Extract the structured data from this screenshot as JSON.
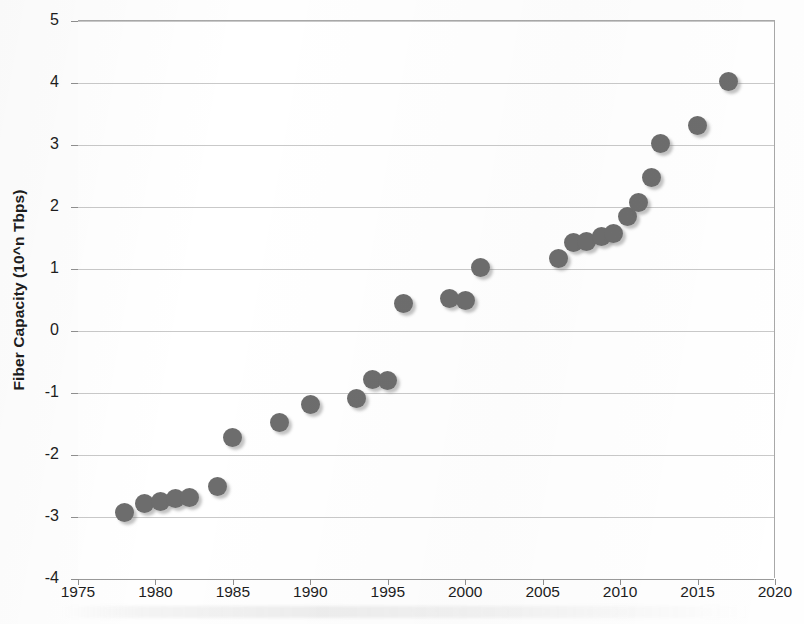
{
  "chart_data": {
    "type": "scatter",
    "title": "",
    "xlabel": "",
    "ylabel": "Fiber Capacity (10^n Tbps)",
    "xlim": [
      1975,
      2020
    ],
    "ylim": [
      -4,
      5
    ],
    "grid": true,
    "legend": "none",
    "marker_color": "#6d6d6d",
    "xticks": [
      "1975",
      "1980",
      "1985",
      "1990",
      "1995",
      "2000",
      "2005",
      "2010",
      "2015",
      "2020"
    ],
    "yticks": [
      "-4",
      "-3",
      "-2",
      "-1",
      "0",
      "1",
      "2",
      "3",
      "4",
      "5"
    ],
    "series": [
      {
        "name": "Fiber Capacity",
        "points": [
          {
            "x": 1978.0,
            "y": -2.92
          },
          {
            "x": 1979.3,
            "y": -2.78
          },
          {
            "x": 1980.3,
            "y": -2.75
          },
          {
            "x": 1981.3,
            "y": -2.7
          },
          {
            "x": 1982.2,
            "y": -2.68
          },
          {
            "x": 1984.0,
            "y": -2.5
          },
          {
            "x": 1985.0,
            "y": -1.72
          },
          {
            "x": 1988.0,
            "y": -1.47
          },
          {
            "x": 1990.0,
            "y": -1.19
          },
          {
            "x": 1993.0,
            "y": -1.09
          },
          {
            "x": 1994.0,
            "y": -0.78
          },
          {
            "x": 1995.0,
            "y": -0.8
          },
          {
            "x": 1996.0,
            "y": 0.44
          },
          {
            "x": 1999.0,
            "y": 0.53
          },
          {
            "x": 2000.0,
            "y": 0.5
          },
          {
            "x": 2001.0,
            "y": 1.02
          },
          {
            "x": 2006.0,
            "y": 1.17
          },
          {
            "x": 2007.0,
            "y": 1.43
          },
          {
            "x": 2007.8,
            "y": 1.44
          },
          {
            "x": 2008.8,
            "y": 1.52
          },
          {
            "x": 2009.6,
            "y": 1.58
          },
          {
            "x": 2010.5,
            "y": 1.85
          },
          {
            "x": 2011.2,
            "y": 2.08
          },
          {
            "x": 2012.0,
            "y": 2.48
          },
          {
            "x": 2012.6,
            "y": 3.03
          },
          {
            "x": 2015.0,
            "y": 3.32
          },
          {
            "x": 2017.0,
            "y": 4.02
          }
        ]
      }
    ]
  }
}
